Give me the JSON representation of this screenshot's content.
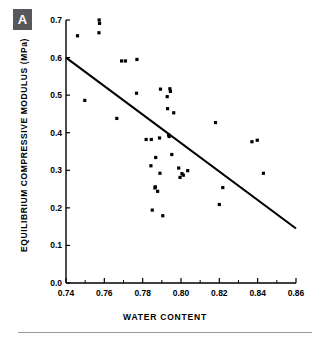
{
  "panel": {
    "letter": "A"
  },
  "axes": {
    "xlabel": "WATER CONTENT",
    "ylabel": "EQUILIBRIUM COMPRESSIVE MODULUS (MPa)",
    "x_ticks": [
      "0.74",
      "0.76",
      "0.78",
      "0.80",
      "0.82",
      "0.84",
      "0.86"
    ],
    "y_ticks": [
      "0.0",
      "0.1",
      "0.2",
      "0.3",
      "0.4",
      "0.5",
      "0.6",
      "0.7"
    ]
  },
  "colors": {
    "badge_bg": "#58585a",
    "badge_text": "#ffffff",
    "axis": "#000000",
    "marker": "#000000",
    "trendline": "#000000",
    "rule": "#9a9a9a",
    "background": "#ffffff"
  },
  "chart_data": {
    "type": "scatter",
    "title": "",
    "xlabel": "WATER CONTENT",
    "ylabel": "EQUILIBRIUM COMPRESSIVE MODULUS (MPa)",
    "xlim": [
      0.74,
      0.86
    ],
    "ylim": [
      0.0,
      0.7
    ],
    "xticks": [
      0.74,
      0.76,
      0.78,
      0.8,
      0.82,
      0.84,
      0.86
    ],
    "yticks": [
      0.0,
      0.1,
      0.2,
      0.3,
      0.4,
      0.5,
      0.6,
      0.7
    ],
    "x_minor_tick_step": 0.01,
    "grid": false,
    "legend": null,
    "series": [
      {
        "name": "specimens",
        "marker": "filled-square",
        "points": [
          [
            0.746,
            0.658
          ],
          [
            0.7498,
            0.486
          ],
          [
            0.7573,
            0.7
          ],
          [
            0.7575,
            0.691
          ],
          [
            0.7572,
            0.666
          ],
          [
            0.769,
            0.591
          ],
          [
            0.771,
            0.591
          ],
          [
            0.7665,
            0.438
          ],
          [
            0.777,
            0.595
          ],
          [
            0.7768,
            0.505
          ],
          [
            0.7818,
            0.382
          ],
          [
            0.7845,
            0.382
          ],
          [
            0.7843,
            0.312
          ],
          [
            0.785,
            0.194
          ],
          [
            0.7868,
            0.334
          ],
          [
            0.7866,
            0.256
          ],
          [
            0.7864,
            0.253
          ],
          [
            0.7878,
            0.244
          ],
          [
            0.7888,
            0.386
          ],
          [
            0.789,
            0.292
          ],
          [
            0.7893,
            0.516
          ],
          [
            0.7905,
            0.179
          ],
          [
            0.7928,
            0.496
          ],
          [
            0.793,
            0.464
          ],
          [
            0.7935,
            0.394
          ],
          [
            0.7938,
            0.39
          ],
          [
            0.7942,
            0.517
          ],
          [
            0.7945,
            0.51
          ],
          [
            0.7952,
            0.342
          ],
          [
            0.7962,
            0.453
          ],
          [
            0.7988,
            0.306
          ],
          [
            0.7995,
            0.281
          ],
          [
            0.8005,
            0.291
          ],
          [
            0.8012,
            0.287
          ],
          [
            0.8035,
            0.299
          ],
          [
            0.818,
            0.427
          ],
          [
            0.82,
            0.209
          ],
          [
            0.8218,
            0.254
          ],
          [
            0.837,
            0.376
          ],
          [
            0.8398,
            0.38
          ],
          [
            0.843,
            0.292
          ]
        ]
      }
    ],
    "trendline": {
      "name": "regression-line",
      "x": [
        0.74,
        0.86
      ],
      "y": [
        0.6,
        0.145
      ]
    }
  }
}
